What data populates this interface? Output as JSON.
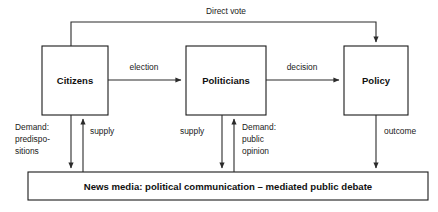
{
  "diagram": {
    "type": "flow-diagram",
    "title_text": "Direct vote",
    "nodes": [
      {
        "id": "citizens",
        "label": "Citizens",
        "x": 42,
        "y": 46,
        "w": 66,
        "h": 69
      },
      {
        "id": "politicians",
        "label": "Politicians",
        "x": 186,
        "y": 46,
        "w": 80,
        "h": 69
      },
      {
        "id": "policy",
        "label": "Policy",
        "x": 344,
        "y": 46,
        "w": 64,
        "h": 69
      }
    ],
    "media_bar": {
      "id": "news-media",
      "label": "News media: political communication – mediated public debate",
      "x": 28,
      "y": 172,
      "w": 400,
      "h": 28
    },
    "edges": [
      {
        "id": "direct-vote",
        "label": "Direct vote",
        "from": "citizens",
        "to": "policy"
      },
      {
        "id": "election",
        "label": "election",
        "from": "citizens",
        "to": "politicians"
      },
      {
        "id": "decision",
        "label": "decision",
        "from": "politicians",
        "to": "policy"
      },
      {
        "id": "demand-predispositions",
        "label": "Demand: predispo- sitions",
        "from": "citizens",
        "to": "news-media"
      },
      {
        "id": "supply-citizens",
        "label": "supply",
        "from": "news-media",
        "to": "citizens"
      },
      {
        "id": "supply-politicians",
        "label": "supply",
        "from": "politicians",
        "to": "news-media"
      },
      {
        "id": "demand-public-opinion",
        "label": "Demand: public opinion",
        "from": "news-media",
        "to": "politicians"
      },
      {
        "id": "outcome",
        "label": "outcome",
        "from": "policy",
        "to": "news-media"
      }
    ],
    "labels": {
      "direct_vote": "Direct vote",
      "election": "election",
      "decision": "decision",
      "demand_predispositions_line1": "Demand:",
      "demand_predispositions_line2": "predispo-",
      "demand_predispositions_line3": "sitions",
      "supply_left": "supply",
      "supply_middle": "supply",
      "demand_public_opinion_line1": "Demand:",
      "demand_public_opinion_line2": "public",
      "demand_public_opinion_line3": "opinion",
      "outcome": "outcome"
    },
    "colors": {
      "stroke": "#2b2b2b",
      "box_stroke": "#1a1a1a",
      "text": "#111111",
      "background": "#ffffff"
    }
  }
}
